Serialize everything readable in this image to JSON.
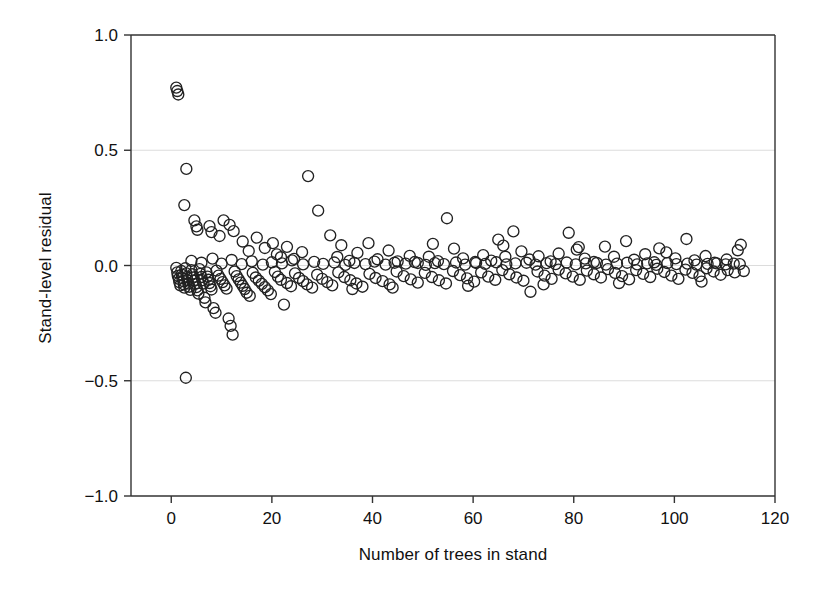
{
  "chart_data": {
    "type": "scatter",
    "title": "",
    "xlabel": "Number of trees in stand",
    "ylabel": "Stand-level residual",
    "xlim": [
      -8,
      120
    ],
    "ylim": [
      -1.0,
      1.0
    ],
    "xticks": [
      0,
      20,
      40,
      60,
      80,
      100,
      120
    ],
    "xtick_labels": [
      "0",
      "20",
      "40",
      "60",
      "80",
      "100",
      "120"
    ],
    "yticks": [
      1.0,
      0.5,
      0.0,
      -0.5,
      -1.0
    ],
    "ytick_labels": [
      "1.0",
      "0.5",
      "0.0",
      "-0.5",
      "-1.0"
    ],
    "grid": true,
    "gridlines_y": [
      0.5,
      0.0,
      -0.5
    ],
    "legend": null,
    "marker": {
      "shape": "open-circle",
      "diameter_px": 11,
      "stroke": "#222222",
      "fill": "none"
    },
    "points": [
      [
        1.0,
        0.772
      ],
      [
        1.2,
        0.757
      ],
      [
        1.4,
        0.742
      ],
      [
        3.0,
        0.419
      ],
      [
        2.6,
        0.262
      ],
      [
        4.6,
        0.196
      ],
      [
        5.0,
        0.17
      ],
      [
        5.2,
        0.155
      ],
      [
        7.6,
        0.171
      ],
      [
        8.0,
        0.145
      ],
      [
        9.6,
        0.128
      ],
      [
        10.4,
        0.196
      ],
      [
        11.6,
        0.176
      ],
      [
        12.4,
        0.149
      ],
      [
        14.2,
        0.104
      ],
      [
        15.4,
        0.063
      ],
      [
        17.0,
        0.121
      ],
      [
        18.6,
        0.076
      ],
      [
        20.2,
        0.097
      ],
      [
        21.0,
        0.048
      ],
      [
        21.8,
        0.036
      ],
      [
        23.0,
        0.081
      ],
      [
        24.4,
        0.029
      ],
      [
        26.0,
        0.058
      ],
      [
        27.2,
        0.388
      ],
      [
        29.2,
        0.238
      ],
      [
        31.6,
        0.131
      ],
      [
        33.0,
        0.037
      ],
      [
        35.4,
        0.02
      ],
      [
        37.0,
        0.055
      ],
      [
        39.2,
        0.097
      ],
      [
        41.0,
        0.027
      ],
      [
        43.2,
        0.065
      ],
      [
        45.0,
        0.018
      ],
      [
        47.4,
        0.042
      ],
      [
        49.0,
        0.011
      ],
      [
        51.2,
        0.038
      ],
      [
        53.0,
        0.019
      ],
      [
        54.8,
        0.205
      ],
      [
        56.2,
        0.073
      ],
      [
        58.0,
        0.031
      ],
      [
        60.4,
        0.015
      ],
      [
        62.0,
        0.045
      ],
      [
        63.6,
        0.021
      ],
      [
        65.0,
        0.112
      ],
      [
        66.4,
        0.038
      ],
      [
        68.0,
        0.148
      ],
      [
        69.6,
        0.061
      ],
      [
        71.2,
        0.026
      ],
      [
        73.0,
        0.04
      ],
      [
        75.4,
        0.018
      ],
      [
        77.0,
        0.052
      ],
      [
        79.0,
        0.142
      ],
      [
        80.6,
        0.069
      ],
      [
        82.2,
        0.03
      ],
      [
        84.0,
        0.015
      ],
      [
        86.2,
        0.082
      ],
      [
        88.0,
        0.038
      ],
      [
        90.4,
        0.106
      ],
      [
        92.0,
        0.025
      ],
      [
        94.2,
        0.049
      ],
      [
        96.0,
        0.014
      ],
      [
        98.4,
        0.057
      ],
      [
        100.2,
        0.031
      ],
      [
        102.4,
        0.115
      ],
      [
        104.0,
        0.022
      ],
      [
        106.2,
        0.041
      ],
      [
        108.0,
        0.012
      ],
      [
        110.4,
        0.026
      ],
      [
        113.2,
        0.09
      ],
      [
        1.0,
        -0.01
      ],
      [
        1.2,
        -0.03
      ],
      [
        1.3,
        -0.045
      ],
      [
        1.5,
        -0.058
      ],
      [
        1.6,
        -0.072
      ],
      [
        1.8,
        -0.086
      ],
      [
        2.0,
        -0.024
      ],
      [
        2.1,
        -0.04
      ],
      [
        2.2,
        -0.055
      ],
      [
        2.4,
        -0.068
      ],
      [
        2.5,
        -0.082
      ],
      [
        2.6,
        -0.096
      ],
      [
        2.8,
        -0.012
      ],
      [
        3.0,
        -0.034
      ],
      [
        3.1,
        -0.05
      ],
      [
        3.2,
        -0.064
      ],
      [
        3.4,
        -0.078
      ],
      [
        3.6,
        -0.092
      ],
      [
        3.8,
        -0.106
      ],
      [
        4.0,
        -0.02
      ],
      [
        4.2,
        -0.038
      ],
      [
        4.4,
        -0.052
      ],
      [
        4.6,
        -0.066
      ],
      [
        4.8,
        -0.08
      ],
      [
        5.0,
        -0.094
      ],
      [
        5.2,
        -0.108
      ],
      [
        5.4,
        -0.122
      ],
      [
        5.6,
        -0.016
      ],
      [
        5.8,
        -0.036
      ],
      [
        6.0,
        -0.05
      ],
      [
        6.2,
        -0.064
      ],
      [
        6.4,
        -0.078
      ],
      [
        6.6,
        -0.14
      ],
      [
        6.8,
        -0.16
      ],
      [
        7.0,
        -0.03
      ],
      [
        7.2,
        -0.048
      ],
      [
        7.4,
        -0.062
      ],
      [
        7.6,
        -0.076
      ],
      [
        7.8,
        -0.09
      ],
      [
        8.0,
        -0.104
      ],
      [
        8.4,
        -0.185
      ],
      [
        8.8,
        -0.205
      ],
      [
        9.0,
        -0.022
      ],
      [
        9.4,
        -0.044
      ],
      [
        9.8,
        -0.058
      ],
      [
        10.2,
        -0.072
      ],
      [
        10.6,
        -0.086
      ],
      [
        11.0,
        -0.1
      ],
      [
        11.4,
        -0.23
      ],
      [
        11.8,
        -0.262
      ],
      [
        12.2,
        -0.3
      ],
      [
        12.6,
        -0.026
      ],
      [
        13.0,
        -0.046
      ],
      [
        13.4,
        -0.06
      ],
      [
        13.8,
        -0.074
      ],
      [
        14.2,
        -0.088
      ],
      [
        14.6,
        -0.102
      ],
      [
        15.0,
        -0.118
      ],
      [
        15.6,
        -0.132
      ],
      [
        16.2,
        -0.032
      ],
      [
        16.8,
        -0.052
      ],
      [
        17.4,
        -0.066
      ],
      [
        18.0,
        -0.08
      ],
      [
        18.6,
        -0.094
      ],
      [
        19.2,
        -0.108
      ],
      [
        19.8,
        -0.124
      ],
      [
        20.6,
        -0.028
      ],
      [
        21.2,
        -0.048
      ],
      [
        21.8,
        -0.062
      ],
      [
        22.4,
        -0.17
      ],
      [
        23.0,
        -0.076
      ],
      [
        23.8,
        -0.09
      ],
      [
        24.6,
        -0.034
      ],
      [
        25.4,
        -0.054
      ],
      [
        26.2,
        -0.068
      ],
      [
        27.0,
        -0.082
      ],
      [
        28.0,
        -0.096
      ],
      [
        29.0,
        -0.04
      ],
      [
        30.0,
        -0.058
      ],
      [
        31.0,
        -0.072
      ],
      [
        32.0,
        -0.086
      ],
      [
        33.2,
        -0.03
      ],
      [
        34.4,
        -0.05
      ],
      [
        35.6,
        -0.064
      ],
      [
        36.8,
        -0.078
      ],
      [
        38.0,
        -0.092
      ],
      [
        39.4,
        -0.036
      ],
      [
        40.6,
        -0.054
      ],
      [
        42.0,
        -0.068
      ],
      [
        43.4,
        -0.082
      ],
      [
        44.8,
        -0.026
      ],
      [
        46.2,
        -0.046
      ],
      [
        47.6,
        -0.06
      ],
      [
        49.0,
        -0.074
      ],
      [
        50.4,
        -0.032
      ],
      [
        51.8,
        -0.05
      ],
      [
        53.2,
        -0.064
      ],
      [
        54.6,
        -0.078
      ],
      [
        56.0,
        -0.024
      ],
      [
        57.4,
        -0.042
      ],
      [
        58.8,
        -0.056
      ],
      [
        60.2,
        -0.07
      ],
      [
        61.6,
        -0.03
      ],
      [
        63.0,
        -0.048
      ],
      [
        64.4,
        -0.062
      ],
      [
        65.8,
        -0.02
      ],
      [
        67.2,
        -0.038
      ],
      [
        68.6,
        -0.052
      ],
      [
        70.0,
        -0.066
      ],
      [
        71.4,
        -0.114
      ],
      [
        72.8,
        -0.026
      ],
      [
        74.2,
        -0.044
      ],
      [
        75.6,
        -0.058
      ],
      [
        77.0,
        -0.018
      ],
      [
        78.4,
        -0.034
      ],
      [
        79.8,
        -0.048
      ],
      [
        81.2,
        -0.062
      ],
      [
        82.6,
        -0.022
      ],
      [
        84.0,
        -0.038
      ],
      [
        85.4,
        -0.052
      ],
      [
        86.8,
        -0.016
      ],
      [
        88.2,
        -0.032
      ],
      [
        89.6,
        -0.046
      ],
      [
        91.0,
        -0.06
      ],
      [
        92.4,
        -0.02
      ],
      [
        93.8,
        -0.036
      ],
      [
        95.2,
        -0.05
      ],
      [
        96.6,
        -0.014
      ],
      [
        98.0,
        -0.028
      ],
      [
        99.4,
        -0.044
      ],
      [
        100.8,
        -0.058
      ],
      [
        102.2,
        -0.018
      ],
      [
        103.6,
        -0.032
      ],
      [
        105.0,
        -0.046
      ],
      [
        106.4,
        -0.012
      ],
      [
        107.8,
        -0.026
      ],
      [
        109.2,
        -0.04
      ],
      [
        110.6,
        -0.02
      ],
      [
        112.0,
        -0.03
      ],
      [
        113.8,
        -0.024
      ],
      [
        2.9,
        -0.487
      ],
      [
        4.0,
        0.02
      ],
      [
        6.0,
        0.012
      ],
      [
        8.2,
        0.03
      ],
      [
        10.0,
        0.008
      ],
      [
        12.0,
        0.024
      ],
      [
        14.0,
        0.006
      ],
      [
        16.0,
        0.018
      ],
      [
        18.2,
        0.004
      ],
      [
        20.0,
        0.014
      ],
      [
        22.0,
        0.009
      ],
      [
        24.0,
        0.022
      ],
      [
        26.2,
        0.005
      ],
      [
        28.4,
        0.016
      ],
      [
        30.2,
        0.007
      ],
      [
        32.4,
        0.013
      ],
      [
        34.6,
        0.003
      ],
      [
        36.4,
        0.011
      ],
      [
        38.6,
        0.006
      ],
      [
        40.4,
        0.017
      ],
      [
        42.6,
        0.004
      ],
      [
        44.4,
        0.012
      ],
      [
        46.6,
        0.008
      ],
      [
        48.4,
        0.015
      ],
      [
        50.6,
        0.003
      ],
      [
        52.4,
        0.01
      ],
      [
        54.2,
        0.006
      ],
      [
        56.6,
        0.013
      ],
      [
        58.4,
        0.004
      ],
      [
        60.6,
        0.011
      ],
      [
        62.4,
        0.007
      ],
      [
        64.6,
        0.014
      ],
      [
        66.6,
        0.005
      ],
      [
        68.4,
        0.009
      ],
      [
        70.6,
        0.012
      ],
      [
        72.4,
        0.004
      ],
      [
        74.6,
        0.01
      ],
      [
        76.4,
        0.006
      ],
      [
        78.6,
        0.013
      ],
      [
        80.4,
        0.005
      ],
      [
        82.4,
        0.009
      ],
      [
        84.6,
        0.011
      ],
      [
        86.4,
        0.004
      ],
      [
        88.6,
        0.008
      ],
      [
        90.6,
        0.012
      ],
      [
        92.6,
        0.005
      ],
      [
        94.6,
        0.009
      ],
      [
        96.4,
        0.003
      ],
      [
        98.6,
        0.01
      ],
      [
        100.4,
        0.006
      ],
      [
        102.6,
        0.008
      ],
      [
        104.4,
        0.004
      ],
      [
        106.6,
        0.007
      ],
      [
        108.4,
        0.009
      ],
      [
        110.2,
        0.005
      ],
      [
        111.8,
        0.008
      ],
      [
        113.0,
        0.006
      ],
      [
        33.8,
        0.088
      ],
      [
        36.0,
        -0.102
      ],
      [
        44.0,
        -0.096
      ],
      [
        52.0,
        0.094
      ],
      [
        59.0,
        -0.088
      ],
      [
        66.0,
        0.086
      ],
      [
        74.0,
        -0.082
      ],
      [
        81.0,
        0.08
      ],
      [
        89.0,
        -0.076
      ],
      [
        97.0,
        0.074
      ],
      [
        105.4,
        -0.07
      ],
      [
        112.6,
        0.066
      ]
    ]
  },
  "geometry": {
    "plot_left": 131,
    "plot_right": 775,
    "plot_top": 35,
    "plot_bottom": 496,
    "axis_left_extent": 131
  }
}
